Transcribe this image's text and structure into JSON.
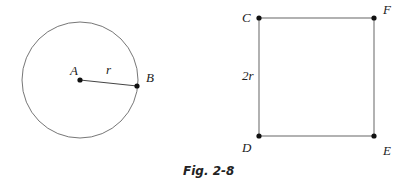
{
  "figure": {
    "caption": "Fig. 2-8",
    "circle": {
      "center_label": "A",
      "point_label": "B",
      "radius_label": "r"
    },
    "square": {
      "corners": [
        "C",
        "F",
        "D",
        "E"
      ],
      "side_label": "2r"
    }
  },
  "colors": {
    "stroke": "#555555",
    "point": "#111111",
    "text": "#222222"
  }
}
